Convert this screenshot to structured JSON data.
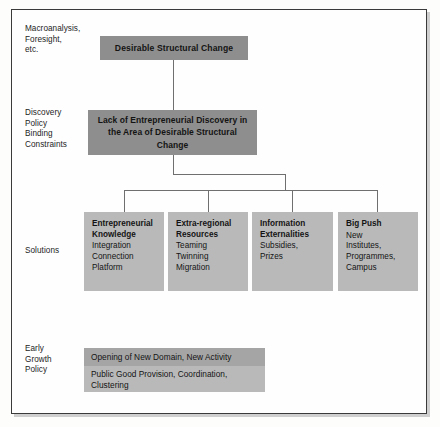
{
  "diagram": {
    "frame": {
      "border_color": "#3a3a3a",
      "background": "#fefefe"
    },
    "palette": {
      "box_dark": "#8e8e8e",
      "box_mid": "#a5a5a5",
      "box_light": "#b9b9b9",
      "connector": "#6f6f6f",
      "text": "#141414"
    },
    "row_labels": [
      {
        "name": "macroanalysis",
        "text": "Macroanalysis,\nForesight,\netc."
      },
      {
        "name": "discovery",
        "text": "Discovery\nPolicy\nBinding\nConstraints"
      },
      {
        "name": "solutions",
        "text": "Solutions"
      },
      {
        "name": "early-growth",
        "text": "Early\nGrowth\nPolicy"
      }
    ],
    "nodes": {
      "top": {
        "label": "Desirable Structural Change"
      },
      "problem": {
        "label": "Lack of Entrepreneurial Discovery\nin the Area of Desirable\nStructural Change"
      },
      "solutions": [
        {
          "title": "Entrepreneurial\nKnowledge",
          "items": "Integration\nConnection\nPlatform"
        },
        {
          "title": "Extra-regional\nResources",
          "items": "Teaming\nTwinning\nMigration"
        },
        {
          "title": "Information\nExternalities",
          "items": "Subsidies,\nPrizes"
        },
        {
          "title": "Big Push",
          "items": "New\nInstitutes,\nProgrammes,\nCampus"
        }
      ],
      "outcomes": [
        {
          "label": "Opening of New Domain, New Activity"
        },
        {
          "label": "Public Good Provision, Coordination,\nClustering"
        }
      ]
    }
  }
}
